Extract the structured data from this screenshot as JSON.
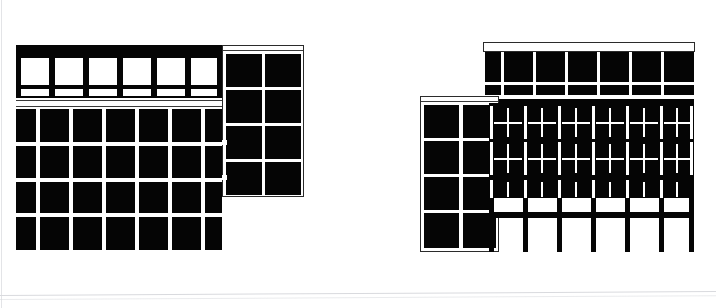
{
  "sheet": {
    "title": "Architectural Elevation Drawings",
    "background_color": "#ffffff",
    "ink_color": "#050505",
    "width": 716,
    "height": 308,
    "scan_edge_color": "#d9dade"
  },
  "drawings": [
    {
      "id": "left-elevation",
      "name": "Left Building Elevation",
      "description": "Black-and-white building elevation with a horizontal glazed ribbon band on the upper floor, a four-storey solid window grid below, and a taller two-bay tower block attached on the right side.",
      "bounds": {
        "x": 14,
        "y": 44,
        "width": 283,
        "height": 206
      },
      "parts": [
        {
          "id": "cornice-band",
          "name": "Top Cornice Band",
          "fill": "#050505",
          "bounds": {
            "x": 16,
            "y": 45,
            "width": 206,
            "height": 7
          }
        },
        {
          "id": "ribbon-window-band",
          "name": "Ribbon Window Band",
          "fill": "#ffffff",
          "frame": "#050505",
          "bays": 6,
          "bounds": {
            "x": 16,
            "y": 52,
            "width": 206,
            "height": 45
          },
          "note": "Six large white glazed panels separated by black mullions, with a narrow spandrel row of small white lights beneath."
        },
        {
          "id": "spandrel-strip",
          "name": "Spandrel Strip",
          "fill": "#ffffff",
          "bounds": {
            "x": 16,
            "y": 99,
            "width": 206,
            "height": 8
          }
        },
        {
          "id": "main-window-grid",
          "name": "Main Window Grid",
          "fill": "#050505",
          "mullion": "#ffffff",
          "columns": 7,
          "rows": 4,
          "bounds": {
            "x": 16,
            "y": 109,
            "width": 206,
            "height": 141
          },
          "note": "Narrow end bay at left and right, five wide bays between; four storeys."
        },
        {
          "id": "right-tower",
          "name": "Right Tower Block",
          "fill": "#050505",
          "mullion": "#ffffff",
          "columns": 2,
          "rows": 4,
          "bounds": {
            "x": 224,
            "y": 46,
            "width": 72,
            "height": 148
          }
        }
      ]
    },
    {
      "id": "right-elevation",
      "name": "Right Building Elevation",
      "description": "Black-and-white building elevation with an attic ribbon band on top, two storeys of cross-mullioned square windows, a band of half-height windows over white spandrels, and an open pilotis colonnade at ground level, with a two-bay tower block attached at the left.",
      "bounds": {
        "x": 420,
        "y": 42,
        "width": 275,
        "height": 210
      },
      "parts": [
        {
          "id": "attic-band",
          "name": "Attic Ribbon Band",
          "fill": "#050505",
          "bays": 7,
          "bounds": {
            "x": 485,
            "y": 43,
            "width": 209,
            "height": 52
          },
          "note": "Black ribbon band divided by thin white mullions into seven bays with a narrow light row below."
        },
        {
          "id": "left-tower",
          "name": "Left Tower Block",
          "fill": "#050505",
          "mullion": "#ffffff",
          "columns": 2,
          "rows": 4,
          "bounds": {
            "x": 420,
            "y": 98,
            "width": 73,
            "height": 152
          }
        },
        {
          "id": "cross-window-floors",
          "name": "Cross-Mullion Window Floors",
          "fill": "#050505",
          "mullion": "#ffffff",
          "columns": 6,
          "rows": 2,
          "bounds": {
            "x": 489,
            "y": 105,
            "width": 205,
            "height": 75
          },
          "note": "Each bay is a black square divided by a white cross into four panes."
        },
        {
          "id": "half-window-band",
          "name": "Half-Height Window Band",
          "fill": "#050505",
          "mullion": "#ffffff",
          "columns": 6,
          "bounds": {
            "x": 489,
            "y": 180,
            "width": 205,
            "height": 16
          }
        },
        {
          "id": "white-spandrel-band",
          "name": "White Spandrel Band",
          "fill": "#ffffff",
          "columns": 6,
          "bounds": {
            "x": 489,
            "y": 196,
            "width": 205,
            "height": 14
          }
        },
        {
          "id": "pilotis-colonnade",
          "name": "Pilotis Colonnade",
          "fill": "#050505",
          "columns": 7,
          "bounds": {
            "x": 489,
            "y": 210,
            "width": 205,
            "height": 42
          },
          "note": "Horizontal ground beam carried on seven slender black columns over open white space."
        }
      ]
    }
  ]
}
